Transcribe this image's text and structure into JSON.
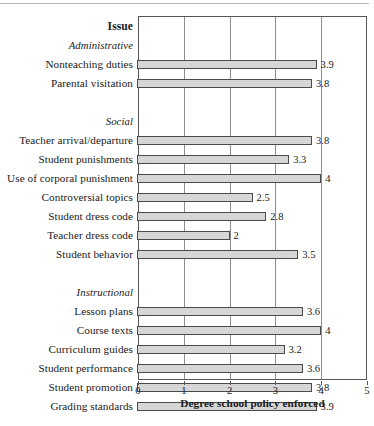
{
  "chart_data": {
    "type": "bar",
    "orientation": "horizontal",
    "title": "",
    "xlabel": "Degree school policy enforced",
    "ylabel": "",
    "column_header": "Issue",
    "xlim": [
      0,
      5
    ],
    "xticks": [
      0,
      1,
      2,
      3,
      4,
      5
    ],
    "grid": true,
    "legend": false,
    "bar_color": "#d6d6d6",
    "bar_edge_color": "#4a4a4a",
    "groups": [
      {
        "name": "Administrative",
        "categories": [
          "Nonteaching duties",
          "Parental visitation"
        ],
        "values": [
          3.9,
          3.8
        ],
        "value_labels": [
          "3.9",
          "3.8"
        ]
      },
      {
        "name": "Social",
        "categories": [
          "Teacher arrival/departure",
          "Student punishments",
          "Use of corporal punishment",
          "Controversial topics",
          "Student dress code",
          "Teacher dress code",
          "Student behavior"
        ],
        "values": [
          3.8,
          3.3,
          4,
          2.5,
          2.8,
          2,
          3.5
        ],
        "value_labels": [
          "3.8",
          "3.3",
          "4",
          "2.5",
          "2.8",
          "2",
          "3.5"
        ]
      },
      {
        "name": "Instructional",
        "categories": [
          "Lesson plans",
          "Course texts",
          "Curriculum guides",
          "Student performance",
          "Student promotion",
          "Grading standards"
        ],
        "values": [
          3.6,
          4,
          3.2,
          3.6,
          3.8,
          3.9
        ],
        "value_labels": [
          "3.6",
          "4",
          "3.2",
          "3.6",
          "3.8",
          "3.9"
        ]
      }
    ]
  },
  "rows": [
    {
      "kind": "header",
      "label": "Issue"
    },
    {
      "kind": "group",
      "label": "Administrative"
    },
    {
      "kind": "bar",
      "label": "Nonteaching duties",
      "value": 3.9,
      "value_label": "3.9"
    },
    {
      "kind": "bar",
      "label": "Parental visitation",
      "value": 3.8,
      "value_label": "3.8"
    },
    {
      "kind": "spacer",
      "label": ""
    },
    {
      "kind": "group",
      "label": "Social"
    },
    {
      "kind": "bar",
      "label": "Teacher arrival/departure",
      "value": 3.8,
      "value_label": "3.8"
    },
    {
      "kind": "bar",
      "label": "Student punishments",
      "value": 3.3,
      "value_label": "3.3"
    },
    {
      "kind": "bar",
      "label": "Use of corporal punishment",
      "value": 4,
      "value_label": "4"
    },
    {
      "kind": "bar",
      "label": "Controversial topics",
      "value": 2.5,
      "value_label": "2.5"
    },
    {
      "kind": "bar",
      "label": "Student dress code",
      "value": 2.8,
      "value_label": "2.8"
    },
    {
      "kind": "bar",
      "label": "Teacher dress code",
      "value": 2,
      "value_label": "2"
    },
    {
      "kind": "bar",
      "label": "Student behavior",
      "value": 3.5,
      "value_label": "3.5"
    },
    {
      "kind": "spacer",
      "label": ""
    },
    {
      "kind": "group",
      "label": "Instructional"
    },
    {
      "kind": "bar",
      "label": "Lesson plans",
      "value": 3.6,
      "value_label": "3.6"
    },
    {
      "kind": "bar",
      "label": "Course texts",
      "value": 4,
      "value_label": "4"
    },
    {
      "kind": "bar",
      "label": "Curriculum guides",
      "value": 3.2,
      "value_label": "3.2"
    },
    {
      "kind": "bar",
      "label": "Student performance",
      "value": 3.6,
      "value_label": "3.6"
    },
    {
      "kind": "bar",
      "label": "Student promotion",
      "value": 3.8,
      "value_label": "3.8"
    },
    {
      "kind": "bar",
      "label": "Grading standards",
      "value": 3.9,
      "value_label": "3.9"
    }
  ]
}
